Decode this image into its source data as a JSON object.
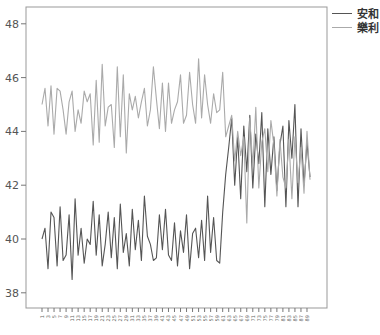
{
  "chart_data": {
    "type": "line",
    "title": "",
    "xlabel": "",
    "ylabel": "",
    "ylim": [
      37.5,
      48.7
    ],
    "yticks": [
      38,
      40,
      42,
      44,
      46,
      48
    ],
    "xtick_labels_note": "odd-numbered tick labels 1,3,5,... rendered rotated",
    "x": [
      1,
      2,
      3,
      4,
      5,
      6,
      7,
      8,
      9,
      10,
      11,
      12,
      13,
      14,
      15,
      16,
      17,
      18,
      19,
      20,
      21,
      22,
      23,
      24,
      25,
      26,
      27,
      28,
      29,
      30,
      31,
      32,
      33,
      34,
      35,
      36,
      37,
      38,
      39,
      40,
      41,
      42,
      43,
      44,
      45,
      46,
      47,
      48,
      49,
      50,
      51,
      52,
      53,
      54,
      55,
      56,
      57,
      58,
      59,
      60,
      61,
      62,
      63,
      64,
      65,
      66,
      67,
      68,
      69,
      70,
      71,
      72,
      73,
      74,
      75,
      76,
      77,
      78,
      79,
      80,
      81,
      82,
      83,
      84,
      85,
      86,
      87,
      88,
      89,
      90
    ],
    "grid": false,
    "legend_position": "top-right-outside",
    "series": [
      {
        "name": "安和",
        "color": "#555555",
        "values": [
          40.0,
          40.4,
          38.9,
          41.0,
          40.8,
          39.0,
          41.2,
          39.2,
          39.4,
          40.9,
          38.5,
          41.5,
          39.4,
          40.4,
          39.1,
          40.0,
          39.8,
          41.4,
          39.4,
          40.9,
          39.0,
          39.8,
          41.0,
          39.3,
          40.8,
          38.9,
          41.3,
          39.5,
          40.2,
          39.0,
          41.1,
          39.6,
          40.7,
          39.2,
          41.6,
          40.1,
          39.8,
          39.2,
          39.3,
          40.9,
          39.6,
          41.1,
          39.4,
          39.2,
          40.6,
          39.0,
          40.3,
          39.5,
          40.9,
          38.9,
          40.2,
          40.4,
          39.3,
          40.7,
          39.2,
          41.6,
          39.5,
          40.8,
          39.2,
          39.1,
          41.0,
          42.4,
          43.4,
          44.5,
          42.0,
          43.8,
          41.5,
          44.2,
          42.5,
          44.6,
          41.9,
          43.9,
          42.8,
          44.7,
          41.2,
          44.1,
          42.4,
          43.8,
          41.8,
          43.5,
          44.2,
          41.2,
          44.4,
          43.0,
          45.0,
          41.2,
          44.1,
          42.0,
          43.6,
          42.3
        ]
      },
      {
        "name": "樂利",
        "color": "#aaaaaa",
        "values": [
          45.0,
          45.6,
          44.2,
          45.7,
          43.9,
          45.6,
          45.5,
          44.8,
          43.9,
          45.1,
          45.5,
          44.0,
          44.8,
          44.3,
          45.5,
          45.1,
          45.4,
          43.5,
          45.9,
          43.6,
          46.5,
          44.2,
          44.9,
          45.0,
          43.4,
          46.4,
          43.8,
          46.1,
          43.2,
          45.4,
          44.8,
          45.3,
          44.5,
          45.1,
          45.6,
          44.2,
          44.8,
          46.4,
          45.2,
          44.1,
          45.8,
          44.0,
          45.8,
          44.3,
          44.8,
          45.1,
          46.1,
          44.3,
          44.6,
          46.2,
          45.0,
          44.3,
          46.7,
          44.5,
          46.1,
          45.0,
          44.3,
          45.4,
          44.7,
          44.8,
          46.2,
          43.8,
          44.2,
          44.6,
          42.9,
          44.0,
          43.1,
          43.8,
          40.6,
          44.5,
          42.7,
          44.9,
          41.9,
          43.6,
          44.1,
          42.5,
          44.4,
          43.5,
          41.6,
          43.7,
          42.3,
          41.9,
          43.7,
          41.5,
          43.8,
          42.1,
          43.4,
          41.7,
          44.0,
          42.2
        ]
      }
    ]
  },
  "legend": {
    "items": [
      {
        "label": "安和",
        "color": "#555555"
      },
      {
        "label": "樂利",
        "color": "#aaaaaa"
      }
    ]
  },
  "axis": {
    "y_tick_labels": [
      "48",
      "46",
      "44",
      "42",
      "40",
      "38"
    ]
  }
}
